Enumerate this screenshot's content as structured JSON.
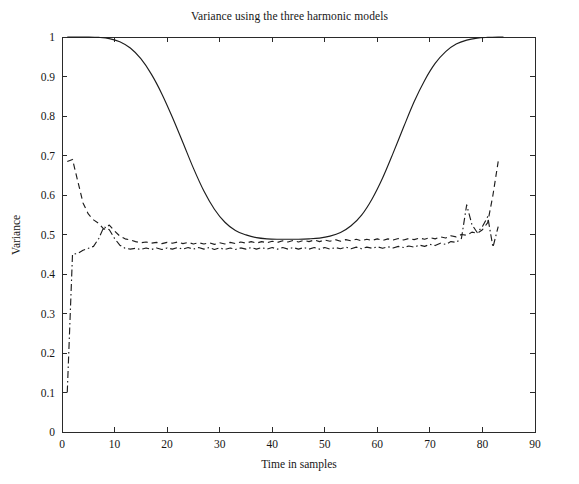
{
  "figure": {
    "width": 579,
    "height": 484,
    "background": "#ffffff",
    "ink_color": "#1d1d1d"
  },
  "chart_data": {
    "type": "line",
    "title": "Variance using the three harmonic models",
    "xlabel": "Time in samples",
    "ylabel": "Variance",
    "xlim": [
      0,
      90
    ],
    "ylim": [
      0,
      1
    ],
    "grid": false,
    "legend": null,
    "xticks": [
      0,
      10,
      20,
      30,
      40,
      50,
      60,
      70,
      80,
      90
    ],
    "xtick_labels": [
      "0",
      "10",
      "20",
      "30",
      "40",
      "50",
      "60",
      "70",
      "80",
      "90"
    ],
    "yticks": [
      0,
      0.1,
      0.2,
      0.3,
      0.4,
      0.5,
      0.6,
      0.7,
      0.8,
      0.9,
      1
    ],
    "ytick_labels": [
      "0",
      "0.1",
      "0.2",
      "0.3",
      "0.4",
      "0.5",
      "0.6",
      "0.7",
      "0.8",
      "0.9",
      "1"
    ],
    "series": [
      {
        "name": "model-1-solid",
        "style": "solid",
        "x": [
          1,
          3,
          5,
          7,
          9,
          11,
          13,
          15,
          17,
          19,
          21,
          23,
          25,
          27,
          29,
          31,
          33,
          35,
          37,
          39,
          41,
          43,
          45,
          47,
          49,
          51,
          53,
          55,
          57,
          59,
          61,
          63,
          65,
          67,
          69,
          71,
          73,
          75,
          77,
          79,
          81,
          83,
          84
        ],
        "y": [
          1.0,
          1.0,
          1.0,
          0.999,
          0.996,
          0.988,
          0.972,
          0.945,
          0.906,
          0.856,
          0.797,
          0.733,
          0.668,
          0.61,
          0.564,
          0.531,
          0.51,
          0.499,
          0.492,
          0.489,
          0.488,
          0.488,
          0.488,
          0.489,
          0.491,
          0.496,
          0.505,
          0.522,
          0.549,
          0.59,
          0.643,
          0.706,
          0.772,
          0.836,
          0.89,
          0.933,
          0.963,
          0.982,
          0.992,
          0.997,
          0.999,
          1.0,
          1.0
        ]
      },
      {
        "name": "model-2-dashed",
        "style": "dashed",
        "x": [
          1,
          2,
          3,
          4,
          5,
          6,
          7,
          8,
          9,
          10,
          11,
          12,
          13,
          14,
          15,
          16,
          17,
          18,
          19,
          20,
          21,
          22,
          23,
          24,
          25,
          26,
          27,
          28,
          29,
          30,
          31,
          32,
          33,
          34,
          35,
          36,
          37,
          38,
          39,
          40,
          41,
          42,
          43,
          44,
          45,
          46,
          47,
          48,
          49,
          50,
          51,
          52,
          53,
          54,
          55,
          56,
          57,
          58,
          59,
          60,
          61,
          62,
          63,
          64,
          65,
          66,
          67,
          68,
          69,
          70,
          71,
          72,
          73,
          74,
          75,
          76,
          77,
          78,
          79,
          80,
          81,
          82,
          83
        ],
        "y": [
          0.685,
          0.69,
          0.635,
          0.58,
          0.552,
          0.537,
          0.528,
          0.513,
          0.524,
          0.509,
          0.496,
          0.489,
          0.486,
          0.482,
          0.479,
          0.481,
          0.478,
          0.48,
          0.477,
          0.48,
          0.478,
          0.481,
          0.477,
          0.48,
          0.476,
          0.479,
          0.476,
          0.479,
          0.475,
          0.479,
          0.476,
          0.48,
          0.477,
          0.481,
          0.478,
          0.482,
          0.478,
          0.482,
          0.479,
          0.483,
          0.48,
          0.484,
          0.481,
          0.485,
          0.481,
          0.485,
          0.482,
          0.486,
          0.482,
          0.486,
          0.483,
          0.487,
          0.483,
          0.487,
          0.484,
          0.488,
          0.484,
          0.488,
          0.485,
          0.489,
          0.485,
          0.489,
          0.486,
          0.49,
          0.486,
          0.49,
          0.487,
          0.491,
          0.488,
          0.492,
          0.489,
          0.494,
          0.491,
          0.497,
          0.494,
          0.5,
          0.498,
          0.506,
          0.503,
          0.512,
          0.53,
          0.6,
          0.685
        ]
      },
      {
        "name": "model-3-dashdot",
        "style": "dashdot",
        "x": [
          1,
          2,
          3,
          4,
          5,
          6,
          7,
          8,
          9,
          10,
          11,
          12,
          13,
          14,
          15,
          16,
          17,
          18,
          19,
          20,
          21,
          22,
          23,
          24,
          25,
          26,
          27,
          28,
          29,
          30,
          31,
          32,
          33,
          34,
          35,
          36,
          37,
          38,
          39,
          40,
          41,
          42,
          43,
          44,
          45,
          46,
          47,
          48,
          49,
          50,
          51,
          52,
          53,
          54,
          55,
          56,
          57,
          58,
          59,
          60,
          61,
          62,
          63,
          64,
          65,
          66,
          67,
          68,
          69,
          70,
          71,
          72,
          73,
          74,
          75,
          76,
          77,
          78,
          79,
          80,
          81,
          82,
          83
        ],
        "y": [
          0.1,
          0.45,
          0.452,
          0.46,
          0.465,
          0.47,
          0.49,
          0.52,
          0.512,
          0.49,
          0.473,
          0.465,
          0.463,
          0.465,
          0.462,
          0.466,
          0.462,
          0.466,
          0.462,
          0.466,
          0.463,
          0.467,
          0.463,
          0.467,
          0.463,
          0.467,
          0.463,
          0.467,
          0.462,
          0.466,
          0.462,
          0.466,
          0.462,
          0.466,
          0.463,
          0.467,
          0.463,
          0.467,
          0.463,
          0.467,
          0.463,
          0.467,
          0.463,
          0.467,
          0.463,
          0.467,
          0.463,
          0.467,
          0.463,
          0.467,
          0.463,
          0.467,
          0.464,
          0.468,
          0.464,
          0.468,
          0.464,
          0.468,
          0.465,
          0.469,
          0.465,
          0.469,
          0.466,
          0.47,
          0.467,
          0.471,
          0.468,
          0.473,
          0.47,
          0.475,
          0.472,
          0.478,
          0.475,
          0.482,
          0.48,
          0.49,
          0.575,
          0.525,
          0.505,
          0.52,
          0.545,
          0.468,
          0.52
        ]
      }
    ],
    "notes": {
      "solid_min": 0.488,
      "solid_max": 1.0,
      "dashed_start": 0.685,
      "dashed_end": 0.685,
      "dashdot_start": 0.1,
      "data_x_end": 84
    }
  }
}
